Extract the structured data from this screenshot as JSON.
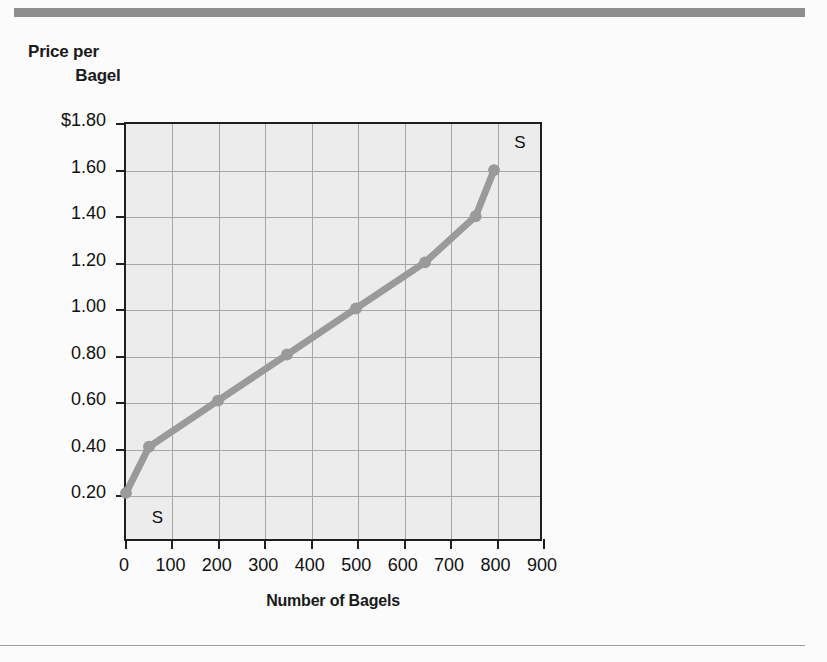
{
  "figure": {
    "y_axis_title_line1": "Price per",
    "y_axis_title_line2": "Bagel",
    "x_axis_title": "Number of Bagels"
  },
  "chart_data": {
    "type": "line",
    "title": "",
    "xlabel": "Number of Bagels",
    "ylabel": "Price per Bagel",
    "xlim": [
      0,
      900
    ],
    "ylim": [
      0.0,
      1.8
    ],
    "grid": true,
    "legend": "none",
    "series": [
      {
        "name": "S",
        "color": "#9a9a9a",
        "marker": "circle",
        "x": [
          0,
          50,
          200,
          350,
          500,
          650,
          760,
          800
        ],
        "y": [
          0.2,
          0.4,
          0.6,
          0.8,
          1.0,
          1.2,
          1.4,
          1.6
        ]
      }
    ],
    "annotations": [
      {
        "text": "S",
        "x": 60,
        "y": 0.1,
        "name": "supply-curve-label-lower"
      },
      {
        "text": "S",
        "x": 840,
        "y": 1.71,
        "name": "supply-curve-label-upper"
      }
    ],
    "xticks": [
      0,
      100,
      200,
      300,
      400,
      500,
      600,
      700,
      800,
      900
    ],
    "xticklabels": [
      "0",
      "100",
      "200",
      "300",
      "400",
      "500",
      "600",
      "700",
      "800",
      "900"
    ],
    "yticks": [
      0.2,
      0.4,
      0.6,
      0.8,
      1.0,
      1.2,
      1.4,
      1.6,
      1.8
    ],
    "yticklabels": [
      "0.20",
      "0.40",
      "0.60",
      "0.80",
      "1.00",
      "1.20",
      "1.40",
      "1.60",
      "$1.80"
    ]
  },
  "colors": {
    "curve": "#9a9a9a",
    "plot_background": "#ececec",
    "axis": "#1f1f1f",
    "grid": "#a7a7a7",
    "rule": "#8d8d8d"
  }
}
